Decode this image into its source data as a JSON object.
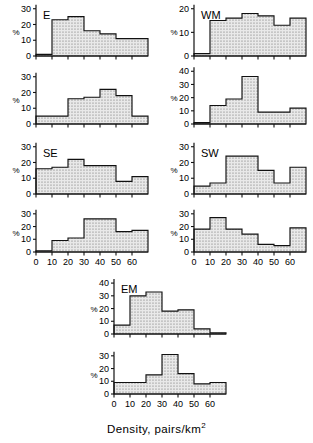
{
  "figure": {
    "x_axis_caption": "Density, pairs/km",
    "x_axis_caption_exponent": "2",
    "y_axis_label": "%",
    "x_ticklabels": [
      "0",
      "10",
      "20",
      "30",
      "40",
      "50",
      "60"
    ],
    "x_ticks": [
      0,
      10,
      20,
      30,
      40,
      50,
      60
    ],
    "x_range": [
      0,
      70
    ],
    "bin_width": 10
  },
  "chart_data": {
    "type": "bar",
    "title": "",
    "xlabel": "Density, pairs/km2",
    "ylabel": "%",
    "grid": false,
    "legend": "none",
    "panels": [
      {
        "id": "E-top",
        "region_label": "E",
        "row": 1,
        "col": 1,
        "yticklabels": [
          "0",
          "10",
          "20",
          "30"
        ],
        "yticks": [
          0,
          10,
          20,
          30
        ],
        "ylim": [
          0,
          33
        ],
        "categories": [
          "0-10",
          "10-20",
          "20-30",
          "30-40",
          "40-50",
          "50-60",
          "60-70"
        ],
        "values": [
          1,
          23,
          25,
          16,
          14,
          11,
          11
        ]
      },
      {
        "id": "WM-top",
        "region_label": "WM",
        "row": 1,
        "col": 2,
        "yticklabels": [
          "0",
          "10",
          "20"
        ],
        "yticks": [
          0,
          10,
          20
        ],
        "ylim": [
          0,
          22
        ],
        "categories": [
          "0-10",
          "10-20",
          "20-30",
          "30-40",
          "40-50",
          "50-60",
          "60-70"
        ],
        "values": [
          1,
          15,
          16,
          18,
          17,
          13,
          16
        ]
      },
      {
        "id": "E-bottom",
        "region_label": "",
        "row": 2,
        "col": 1,
        "yticklabels": [
          "0",
          "10",
          "20",
          "30"
        ],
        "yticks": [
          0,
          10,
          20,
          30
        ],
        "ylim": [
          0,
          33
        ],
        "categories": [
          "0-10",
          "10-20",
          "20-30",
          "30-40",
          "40-50",
          "50-60",
          "60-70"
        ],
        "values": [
          5,
          5,
          16,
          17,
          22,
          18,
          5
        ]
      },
      {
        "id": "WM-bottom",
        "region_label": "",
        "row": 2,
        "col": 2,
        "yticklabels": [
          "0",
          "10",
          "20",
          "30",
          "40"
        ],
        "yticks": [
          0,
          10,
          20,
          30,
          40
        ],
        "ylim": [
          0,
          44
        ],
        "categories": [
          "0-10",
          "10-20",
          "20-30",
          "30-40",
          "40-50",
          "50-60",
          "60-70"
        ],
        "values": [
          1,
          14,
          19,
          36,
          9,
          9,
          12
        ]
      },
      {
        "id": "SE-top",
        "region_label": "SE",
        "row": 3,
        "col": 1,
        "yticklabels": [
          "0",
          "10",
          "20",
          "30"
        ],
        "yticks": [
          0,
          10,
          20,
          30
        ],
        "ylim": [
          0,
          33
        ],
        "categories": [
          "0-10",
          "10-20",
          "20-30",
          "30-40",
          "40-50",
          "50-60",
          "60-70"
        ],
        "values": [
          16,
          17,
          22,
          18,
          18,
          8,
          11
        ]
      },
      {
        "id": "SW-top",
        "region_label": "SW",
        "row": 3,
        "col": 2,
        "yticklabels": [
          "0",
          "10",
          "20",
          "30"
        ],
        "yticks": [
          0,
          10,
          20,
          30
        ],
        "ylim": [
          0,
          33
        ],
        "categories": [
          "0-10",
          "10-20",
          "20-30",
          "30-40",
          "40-50",
          "50-60",
          "60-70"
        ],
        "values": [
          5,
          7,
          24,
          24,
          15,
          7,
          17
        ]
      },
      {
        "id": "SE-bottom",
        "region_label": "",
        "row": 4,
        "col": 1,
        "yticklabels": [
          "0",
          "10",
          "20",
          "30"
        ],
        "yticks": [
          0,
          10,
          20,
          30
        ],
        "ylim": [
          0,
          33
        ],
        "categories": [
          "0-10",
          "10-20",
          "20-30",
          "30-40",
          "40-50",
          "50-60",
          "60-70"
        ],
        "values": [
          1,
          9,
          11,
          26,
          26,
          16,
          17
        ]
      },
      {
        "id": "SW-bottom",
        "region_label": "",
        "row": 4,
        "col": 2,
        "yticklabels": [
          "0",
          "10",
          "20",
          "30"
        ],
        "yticks": [
          0,
          10,
          20,
          30
        ],
        "ylim": [
          0,
          33
        ],
        "categories": [
          "0-10",
          "10-20",
          "20-30",
          "30-40",
          "40-50",
          "50-60",
          "60-70"
        ],
        "values": [
          18,
          27,
          18,
          14,
          6,
          5,
          19
        ]
      },
      {
        "id": "EM-top",
        "region_label": "EM",
        "row": 5,
        "col": 1,
        "yticklabels": [
          "0",
          "10",
          "20",
          "30",
          "40"
        ],
        "yticks": [
          0,
          10,
          20,
          30,
          40
        ],
        "ylim": [
          0,
          44
        ],
        "categories": [
          "0-10",
          "10-20",
          "20-30",
          "30-40",
          "40-50",
          "50-60",
          "60-70"
        ],
        "values": [
          7,
          30,
          33,
          18,
          19,
          4,
          1
        ]
      },
      {
        "id": "EM-bottom",
        "region_label": "",
        "row": 6,
        "col": 1,
        "yticklabels": [
          "0",
          "10",
          "20",
          "30"
        ],
        "yticks": [
          0,
          10,
          20,
          30
        ],
        "ylim": [
          0,
          33
        ],
        "categories": [
          "0-10",
          "10-20",
          "20-30",
          "30-40",
          "40-50",
          "50-60",
          "60-70"
        ],
        "values": [
          9,
          9,
          15,
          31,
          16,
          8,
          9
        ]
      }
    ]
  }
}
